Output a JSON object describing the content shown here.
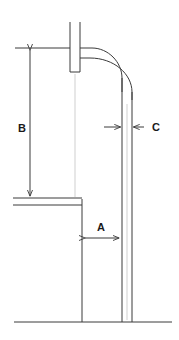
{
  "diagram": {
    "type": "engineering-dimension-drawing",
    "background_color": "#ffffff",
    "line_color": "#3a3a3a",
    "faint_line_color": "#c9c9c9",
    "label_color": "#1a1a1a",
    "dimensions": [
      {
        "id": "A",
        "label": "A",
        "orientation": "horizontal",
        "style": "double-headed-arrow",
        "description": "horizontal clearance from left wall to inner face of downcomer",
        "label_x": 101,
        "label_y": 231,
        "line_y": 238,
        "x_start": 83,
        "x_end": 121
      },
      {
        "id": "B",
        "label": "B",
        "orientation": "vertical",
        "style": "double-headed-arrow",
        "description": "vertical height from upper reference line to shelf",
        "label_x": 22,
        "label_y": 132,
        "line_x": 30,
        "y_start": 48,
        "y_end": 198
      },
      {
        "id": "C",
        "label": "C",
        "orientation": "horizontal",
        "style": "opposing-arrows-wall-thickness",
        "description": "wall thickness of the vertical downcomer tube",
        "label_x": 152,
        "label_y": 131,
        "line_y": 127,
        "x_inner": 122,
        "x_outer": 132,
        "leader_x_end": 144
      }
    ],
    "geometry": {
      "standpipe": {
        "left_wall_x": 70,
        "right_wall_x": 80,
        "top_y": 22,
        "bottom_y": 72
      },
      "elbow": {
        "description": "90 degree bend from standpipe top to vertical downcomer",
        "start_y_inner": 48,
        "start_y_outer": 58,
        "end_x_inner": 122,
        "end_x_outer": 132,
        "end_y": 90
      },
      "downcomer": {
        "inner_wall_x": 122,
        "outer_wall_x": 132,
        "bottom_y": 322
      },
      "left_vessel_wall": {
        "x": 82,
        "top_y": 198,
        "bottom_y": 322
      },
      "shelf": {
        "x_start": 13,
        "x_end": 82,
        "y_top": 198,
        "y_bottom": 205
      },
      "upper_reference_line": {
        "x_start": 15,
        "x_end": 70,
        "y": 48
      },
      "ground_line": {
        "x_start": 14,
        "x_end": 172,
        "y": 322
      }
    }
  }
}
